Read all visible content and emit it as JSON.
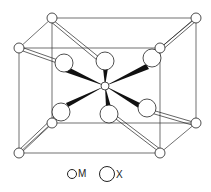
{
  "figure": {
    "colors": {
      "line": "#222222",
      "bond_fill": "#111111",
      "atom_fill": "#ffffff",
      "background": "#ffffff"
    }
  },
  "legend": {
    "items": [
      {
        "symbol": "small-circle",
        "label": "M"
      },
      {
        "symbol": "large-circle",
        "label": "X"
      }
    ]
  }
}
